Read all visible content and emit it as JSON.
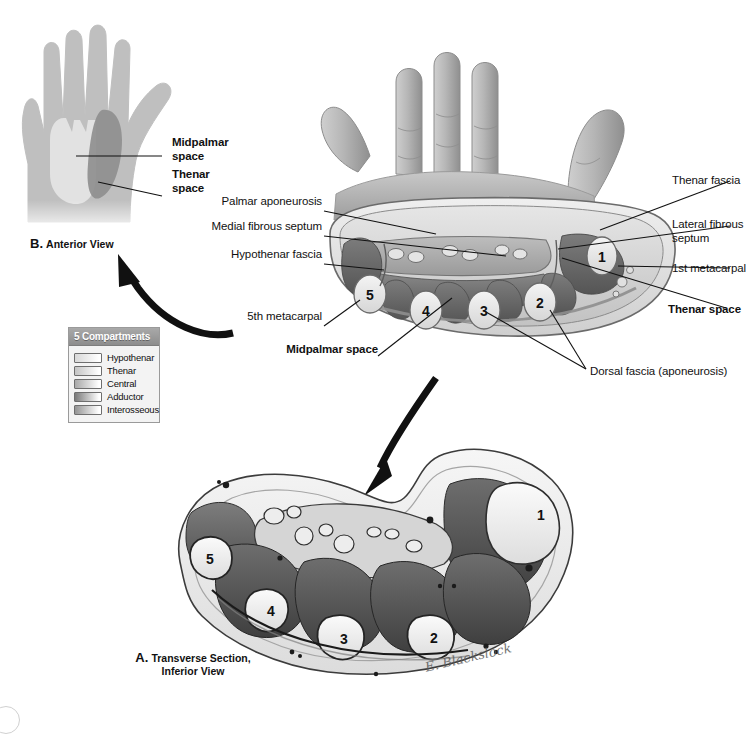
{
  "figure": {
    "signature": "E. Blackslock"
  },
  "panel_b": {
    "caption_letter": "B.",
    "caption_text": "Anterior View",
    "labels": [
      {
        "id": "midpalmar-space",
        "text": "Midpalmar\nspace",
        "bold": true
      },
      {
        "id": "thenar-space",
        "text": "Thenar\nspace",
        "bold": true
      }
    ]
  },
  "legend": {
    "title": "5 Compartments",
    "items": [
      {
        "label": "Hypothenar",
        "color": "#d8d8d8"
      },
      {
        "label": "Thenar",
        "color": "#c4c4c4"
      },
      {
        "label": "Central",
        "color": "#a8a8a8"
      },
      {
        "label": "Adductor",
        "color": "#7a7a7a"
      },
      {
        "label": "Interosseous",
        "color": "#949494"
      }
    ]
  },
  "panel_c": {
    "labels_left": [
      {
        "id": "palmar-aponeurosis",
        "text": "Palmar aponeurosis",
        "bold": false
      },
      {
        "id": "medial-fibrous-septum",
        "text": "Medial fibrous septum",
        "bold": false
      },
      {
        "id": "hypothenar-fascia",
        "text": "Hypothenar fascia",
        "bold": false
      },
      {
        "id": "fifth-metacarpal",
        "text": "5th metacarpal",
        "bold": false
      },
      {
        "id": "midpalmar-space",
        "text": "Midpalmar space",
        "bold": true
      }
    ],
    "labels_right": [
      {
        "id": "thenar-fascia",
        "text": "Thenar fascia",
        "bold": false
      },
      {
        "id": "lateral-fibrous-septum",
        "text": "Lateral fibrous\nseptum",
        "bold": false
      },
      {
        "id": "first-metacarpal",
        "text": "1st metacarpal",
        "bold": false
      },
      {
        "id": "thenar-space",
        "text": "Thenar space",
        "bold": true
      },
      {
        "id": "dorsal-fascia",
        "text": "Dorsal fascia (aponeurosis)",
        "bold": false
      }
    ],
    "metacarpal_numbers": [
      "1",
      "2",
      "3",
      "4",
      "5"
    ]
  },
  "panel_a": {
    "caption_letter": "A.",
    "caption_line1": "Transverse Section,",
    "caption_line2": "Inferior View",
    "metacarpal_numbers": [
      "1",
      "2",
      "3",
      "4",
      "5"
    ]
  },
  "colors": {
    "ink": "#111111",
    "legend_header_bg": "#9a9a9a",
    "legend_body_bg": "#f3f3f3",
    "skin_light": "#c9c9c9",
    "skin_mid": "#b0b0b0",
    "muscle_dark": "#6f6f6f",
    "bone_light": "#e8e8e8"
  }
}
